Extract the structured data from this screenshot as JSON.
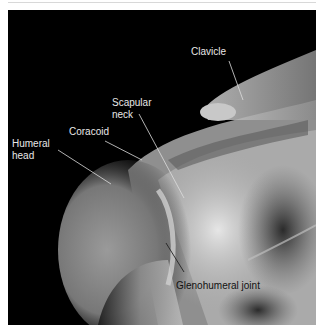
{
  "figure": {
    "labels": [
      {
        "id": "clavicle",
        "text": "Clavicle"
      },
      {
        "id": "scapular-neck",
        "line1": "Scapular",
        "line2": "neck"
      },
      {
        "id": "coracoid",
        "text": "Coracoid"
      },
      {
        "id": "humeral-head",
        "line1": "Humeral",
        "line2": "head"
      },
      {
        "id": "glenohumeral-joint",
        "text": "Glenohumeral joint"
      }
    ],
    "colors": {
      "background": "#000000",
      "label_light": "#e8e8e8",
      "label_dark": "#111111",
      "leader_light": "#dddddd",
      "leader_dark": "#222222"
    }
  }
}
